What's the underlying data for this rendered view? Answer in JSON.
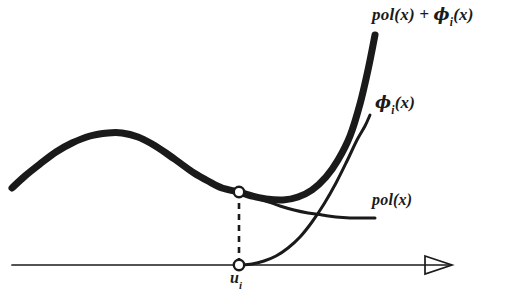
{
  "figure": {
    "kind": "hand-drawn-math-diagram",
    "background_color": "#ffffff",
    "ink_color": "#1a1a1a",
    "width": 507,
    "height": 296,
    "labels": {
      "sum_curve": "pol(x) + ϕi(x)",
      "sum_curve_parts": {
        "head": "pol(x) + ",
        "phi": "ϕ",
        "sub": "i",
        "tail": "(x)"
      },
      "phi_curve": "ϕi(x)",
      "phi_curve_parts": {
        "phi": "ϕ",
        "sub": "i",
        "tail": "(x)"
      },
      "pol_curve": "pol(x)",
      "axis_point": "ui",
      "axis_point_parts": {
        "base": "u",
        "sub": "i"
      }
    }
  },
  "chart_data": {
    "type": "line",
    "title": "",
    "xlabel": "",
    "ylabel": "",
    "xlim": [
      0,
      507
    ],
    "ylim": [
      296,
      0
    ],
    "grid": false,
    "legend": "inline-annotations",
    "axes": {
      "x_axis": {
        "y_pixel": 265,
        "x_start": 12,
        "x_end": 452,
        "arrowhead": "hollow-triangle-right",
        "arrow_tip_x": 452,
        "stroke_width": 1.6
      },
      "y_axis_shown": false
    },
    "annotations": [
      {
        "name": "tangency-point",
        "x": 239,
        "y": 192,
        "marker": "open-circle"
      },
      {
        "name": "axis-point-ui",
        "x": 239,
        "y": 265,
        "marker": "open-circle",
        "label": "ui"
      },
      {
        "name": "dashed-drop-line",
        "x": 239,
        "y_top": 192,
        "y_bottom": 265,
        "style": "dashed"
      }
    ],
    "series": [
      {
        "name": "pol(x) + ϕi(x)",
        "style": "thick",
        "stroke_width": 7,
        "label_position": {
          "x": 372,
          "y": 14
        },
        "points": [
          [
            12,
            188
          ],
          [
            25,
            176
          ],
          [
            40,
            164
          ],
          [
            56,
            152
          ],
          [
            72,
            143
          ],
          [
            90,
            136
          ],
          [
            108,
            133
          ],
          [
            122,
            133
          ],
          [
            138,
            137
          ],
          [
            152,
            144
          ],
          [
            166,
            153
          ],
          [
            180,
            163
          ],
          [
            194,
            173
          ],
          [
            208,
            181
          ],
          [
            222,
            188
          ],
          [
            239,
            192
          ],
          [
            252,
            196
          ],
          [
            266,
            199
          ],
          [
            283,
            200
          ],
          [
            298,
            197
          ],
          [
            312,
            190
          ],
          [
            326,
            177
          ],
          [
            338,
            160
          ],
          [
            350,
            136
          ],
          [
            360,
            104
          ],
          [
            368,
            70
          ],
          [
            375,
            35
          ]
        ]
      },
      {
        "name": "ϕi(x)",
        "style": "thin",
        "stroke_width": 3,
        "label_position": {
          "x": 375,
          "y": 102
        },
        "points": [
          [
            239,
            265
          ],
          [
            252,
            264
          ],
          [
            264,
            261
          ],
          [
            276,
            256
          ],
          [
            288,
            248
          ],
          [
            300,
            237
          ],
          [
            312,
            222
          ],
          [
            324,
            204
          ],
          [
            336,
            183
          ],
          [
            347,
            161
          ],
          [
            357,
            140
          ],
          [
            365,
            126
          ],
          [
            370,
            115
          ]
        ]
      },
      {
        "name": "pol(x)",
        "style": "thin",
        "stroke_width": 3,
        "label_position": {
          "x": 372,
          "y": 200
        },
        "points": [
          [
            239,
            192
          ],
          [
            252,
            196
          ],
          [
            266,
            201
          ],
          [
            280,
            206
          ],
          [
            294,
            210
          ],
          [
            308,
            213
          ],
          [
            322,
            215
          ],
          [
            336,
            217
          ],
          [
            350,
            218
          ],
          [
            362,
            218
          ],
          [
            375,
            218
          ]
        ]
      }
    ]
  }
}
